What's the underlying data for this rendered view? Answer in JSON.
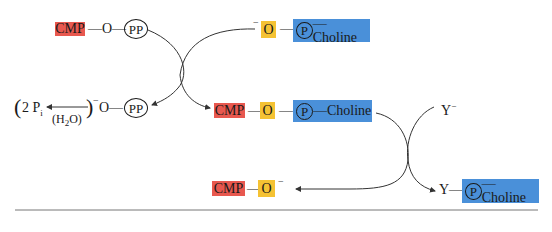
{
  "colors": {
    "cmp": "#e8584f",
    "oxy": "#f5c233",
    "pch": "#4a90d9",
    "line": "#333333"
  },
  "row1": {
    "cmp_label": "CMP",
    "bond1": "—O—",
    "pp_label": "PP",
    "o_charge": "−",
    "o_label": "O",
    "dash": "—",
    "p_label": "P",
    "choline_label": "—Choline"
  },
  "row2": {
    "paren_open": "(",
    "pi_label": "2 P",
    "pi_sub": "i",
    "water_label": "(H",
    "water_sub": "2",
    "water_end": "O)",
    "paren_close": ")",
    "charge": "−",
    "bond": "O—",
    "pp_label": "PP",
    "cmp_label": "CMP",
    "dash1": "—",
    "o_label": "O",
    "dash2": "—",
    "p_label": "P",
    "choline_label": "—Choline",
    "y_label": "Y",
    "y_charge": "−"
  },
  "row3": {
    "cmp_label": "CMP",
    "dash": "—",
    "o_label": "O",
    "o_charge": "−",
    "y_label": "Y—",
    "p_label": "P",
    "choline_label": "—Choline"
  }
}
